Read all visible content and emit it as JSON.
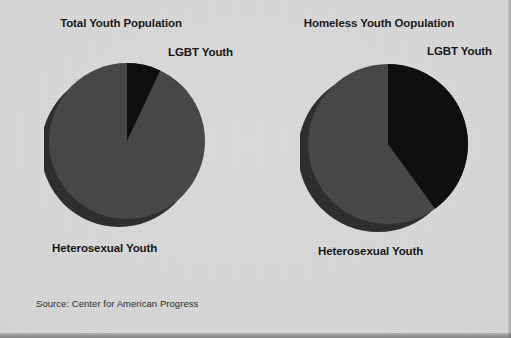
{
  "figure": {
    "background_color": "#d9d9d9",
    "source_note": "Source: Center for American Progress"
  },
  "charts": [
    {
      "title": "Total Youth Population",
      "lgbt_label": "LGBT Youth",
      "hetero_label": "Heterosexual Youth"
    },
    {
      "title": "Homeless Youth Oopulation",
      "lgbt_label": "LGBT Youth",
      "hetero_label": "Heterosexual Youth"
    }
  ],
  "chart_data": [
    {
      "type": "pie",
      "title": "Total Youth Population",
      "labels": [
        "LGBT Youth",
        "Heterosexual Youth"
      ],
      "values": [
        7,
        93
      ],
      "colors": [
        "#0a0a0a",
        "#454545"
      ],
      "start_angle_deg": 0,
      "direction": "clockwise",
      "three_d": true,
      "side_color": "#2b2b2b",
      "legend": "none",
      "annotations": [
        "LGBT Youth",
        "Heterosexual Youth"
      ]
    },
    {
      "type": "pie",
      "title": "Homeless Youth Oopulation",
      "labels": [
        "LGBT Youth",
        "Heterosexual Youth"
      ],
      "values": [
        40,
        60
      ],
      "colors": [
        "#0a0a0a",
        "#454545"
      ],
      "start_angle_deg": 0,
      "direction": "clockwise",
      "three_d": true,
      "side_color": "#2b2b2b",
      "legend": "none",
      "annotations": [
        "LGBT Youth",
        "Heterosexual Youth"
      ]
    }
  ]
}
